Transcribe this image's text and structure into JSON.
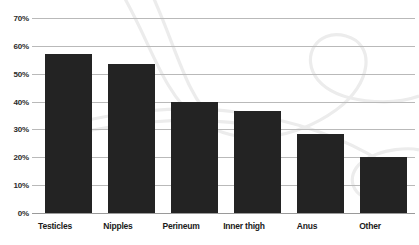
{
  "chart_data": {
    "type": "bar",
    "title": "",
    "subtitle": "",
    "xlabel": "",
    "ylabel": "",
    "ylim": [
      0,
      70
    ],
    "ytick_labels": [
      "0%",
      "10%",
      "20%",
      "30%",
      "40%",
      "50%",
      "60%",
      "70%"
    ],
    "ytick_values": [
      0,
      10,
      20,
      30,
      40,
      50,
      60,
      70
    ],
    "grid": true,
    "legend": "none",
    "categories": [
      "Testicles",
      "Nipples",
      "Perineum",
      "Inner thigh",
      "Anus",
      "Other"
    ],
    "values": [
      57,
      53.5,
      40,
      36.5,
      28.5,
      20
    ],
    "value_labels": [
      "57%",
      "53.5%",
      "40%",
      "36.5%",
      "28.5%",
      "20%"
    ],
    "bar_color": "#232323",
    "grid_color": "#b9b9b9",
    "axis_color": "#9a9a9a",
    "background_color": "#ffffff",
    "watermark_color": "#ededed"
  }
}
